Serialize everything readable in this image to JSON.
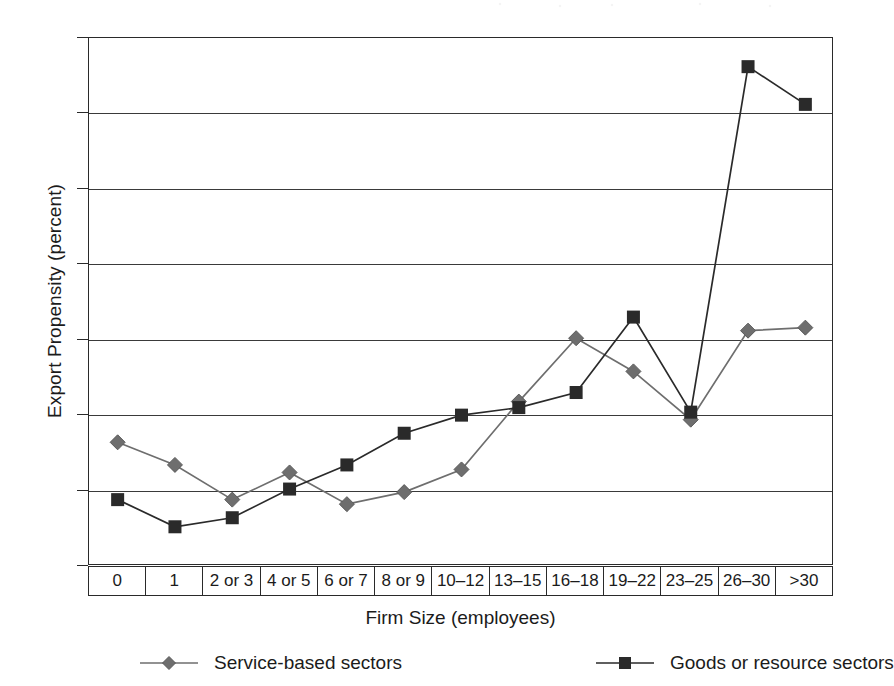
{
  "chart_data": {
    "type": "line",
    "title": "",
    "xlabel": "Firm Size (employees)",
    "ylabel": "Export Propensity (percent)",
    "ylim": [
      0,
      35
    ],
    "yticks": [
      0,
      5,
      10,
      15,
      20,
      25,
      30,
      35
    ],
    "grid": "horizontal",
    "legend_position": "bottom",
    "categories": [
      "0",
      "1",
      "2 or 3",
      "4 or 5",
      "6 or 7",
      "8 or 9",
      "10–12",
      "13–15",
      "16–18",
      "19–22",
      "23–25",
      "26–30",
      ">30"
    ],
    "series": [
      {
        "name": "Service-based sectors",
        "marker": "diamond",
        "color": "#6e6e6e",
        "values": [
          8.2,
          6.7,
          4.4,
          6.2,
          4.1,
          4.9,
          6.4,
          10.9,
          15.1,
          12.9,
          9.7,
          15.6,
          15.8
        ]
      },
      {
        "name": "Goods or resource sectors",
        "marker": "square",
        "color": "#2a2a2a",
        "values": [
          4.4,
          2.6,
          3.2,
          5.1,
          6.7,
          8.8,
          10.0,
          10.5,
          11.5,
          16.5,
          10.2,
          33.1,
          30.6
        ]
      }
    ]
  },
  "legend": {
    "entries": [
      {
        "label": "Service-based sectors"
      },
      {
        "label": "Goods or resource sectors"
      }
    ]
  }
}
